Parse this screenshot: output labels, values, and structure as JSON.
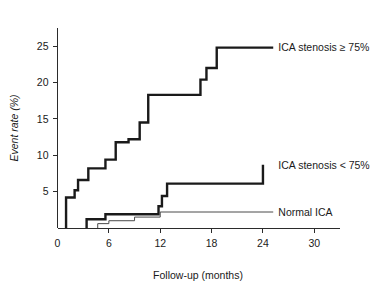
{
  "chart_data": {
    "type": "line",
    "subtype": "kaplan-meier-step",
    "title": "",
    "xlabel": "Follow-up (months)",
    "ylabel": "Event rate (%)",
    "xlim": [
      0,
      33
    ],
    "ylim": [
      0,
      27.5
    ],
    "xticks": [
      0,
      6,
      12,
      18,
      24,
      30
    ],
    "xtick_labels": [
      "0",
      "6",
      "12",
      "18",
      "24",
      "30"
    ],
    "yticks": [
      5,
      10,
      15,
      20,
      25
    ],
    "ytick_labels": [
      "5",
      "10",
      "15",
      "20",
      "25"
    ],
    "grid": false,
    "legend_position": "inline-right",
    "series": [
      {
        "name": "ICA stenosis ≥ 75%",
        "label": "ICA stenosis ≥ 75%",
        "style": "thick",
        "label_x": 25.8,
        "label_y": 24.8,
        "points": [
          {
            "x": 1.0,
            "y": 0.0
          },
          {
            "x": 1.0,
            "y": 4.2
          },
          {
            "x": 2.0,
            "y": 4.2
          },
          {
            "x": 2.0,
            "y": 5.2
          },
          {
            "x": 2.4,
            "y": 5.2
          },
          {
            "x": 2.4,
            "y": 6.6
          },
          {
            "x": 3.6,
            "y": 6.6
          },
          {
            "x": 3.6,
            "y": 8.2
          },
          {
            "x": 5.6,
            "y": 8.2
          },
          {
            "x": 5.6,
            "y": 9.4
          },
          {
            "x": 6.8,
            "y": 9.4
          },
          {
            "x": 6.8,
            "y": 11.8
          },
          {
            "x": 8.3,
            "y": 11.8
          },
          {
            "x": 8.3,
            "y": 12.2
          },
          {
            "x": 9.6,
            "y": 12.2
          },
          {
            "x": 9.6,
            "y": 14.5
          },
          {
            "x": 10.6,
            "y": 14.5
          },
          {
            "x": 10.6,
            "y": 18.3
          },
          {
            "x": 16.7,
            "y": 18.3
          },
          {
            "x": 16.7,
            "y": 20.4
          },
          {
            "x": 17.4,
            "y": 20.4
          },
          {
            "x": 17.4,
            "y": 22.0
          },
          {
            "x": 18.6,
            "y": 22.0
          },
          {
            "x": 18.6,
            "y": 24.8
          },
          {
            "x": 25.2,
            "y": 24.8
          }
        ]
      },
      {
        "name": "ICA stenosis < 75%",
        "label": "ICA stenosis < 75%",
        "style": "thick",
        "label_x": 25.8,
        "label_y": 8.7,
        "points": [
          {
            "x": 3.4,
            "y": 0.0
          },
          {
            "x": 3.4,
            "y": 1.2
          },
          {
            "x": 5.6,
            "y": 1.2
          },
          {
            "x": 5.6,
            "y": 1.9
          },
          {
            "x": 11.8,
            "y": 1.9
          },
          {
            "x": 11.8,
            "y": 3.0
          },
          {
            "x": 12.2,
            "y": 3.0
          },
          {
            "x": 12.2,
            "y": 4.4
          },
          {
            "x": 12.8,
            "y": 4.4
          },
          {
            "x": 12.8,
            "y": 6.1
          },
          {
            "x": 24.0,
            "y": 6.1
          },
          {
            "x": 24.0,
            "y": 8.7
          }
        ]
      },
      {
        "name": "Normal ICA",
        "label": "Normal ICA",
        "style": "thin",
        "label_x": 25.8,
        "label_y": 2.2,
        "points": [
          {
            "x": 4.7,
            "y": 0.0
          },
          {
            "x": 4.7,
            "y": 0.6
          },
          {
            "x": 6.0,
            "y": 0.6
          },
          {
            "x": 6.0,
            "y": 1.0
          },
          {
            "x": 9.0,
            "y": 1.0
          },
          {
            "x": 9.0,
            "y": 1.5
          },
          {
            "x": 12.0,
            "y": 1.5
          },
          {
            "x": 12.0,
            "y": 2.2
          },
          {
            "x": 25.2,
            "y": 2.2
          }
        ]
      }
    ]
  }
}
